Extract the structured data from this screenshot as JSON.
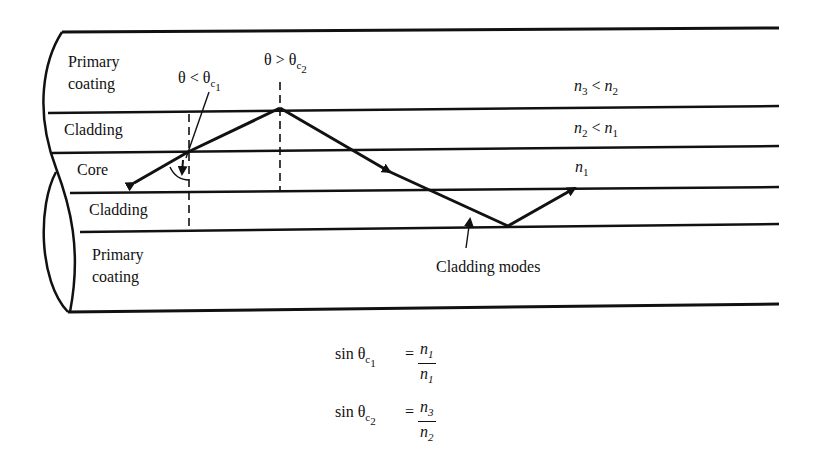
{
  "diagram": {
    "type": "optical-fiber-cross-section",
    "layers": [
      {
        "name": "primary-coating-top",
        "label_line1": "Primary",
        "label_line2": "coating",
        "index_label": "n3 < n2"
      },
      {
        "name": "cladding-top",
        "label": "Cladding",
        "index_label": "n2 < n1"
      },
      {
        "name": "core",
        "label": "Core",
        "index_label": "n1"
      },
      {
        "name": "cladding-bottom",
        "label": "Cladding"
      },
      {
        "name": "primary-coating-bottom",
        "label_line1": "Primary",
        "label_line2": "coating"
      }
    ],
    "annotations": {
      "angle_less": {
        "theta": "θ",
        "op": " < ",
        "theta_c": "θ",
        "sub_c": "c",
        "sub_n": "1"
      },
      "angle_greater": {
        "theta": "θ",
        "op": " > ",
        "theta_c": "θ",
        "sub_c": "c",
        "sub_n": "2"
      },
      "cladding_modes": "Cladding modes"
    },
    "index_labels": {
      "n3_lt_n2": {
        "a": "n",
        "a_sub": "3",
        "op": " < ",
        "b": "n",
        "b_sub": "2"
      },
      "n2_lt_n1": {
        "a": "n",
        "a_sub": "2",
        "op": " < ",
        "b": "n",
        "b_sub": "1"
      },
      "n1": {
        "a": "n",
        "a_sub": "1"
      }
    },
    "equations": [
      {
        "lhs": "sin θ",
        "sub_c": "c",
        "sub_n": "1",
        "eq": "=",
        "num": "n",
        "num_sub": "1",
        "den": "n",
        "den_sub": "1"
      },
      {
        "lhs": "sin θ",
        "sub_c": "c",
        "sub_n": "2",
        "eq": "=",
        "num": "n",
        "num_sub": "3",
        "den": "n",
        "den_sub": "2"
      }
    ]
  }
}
